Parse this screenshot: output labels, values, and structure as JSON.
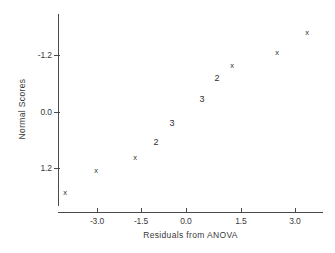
{
  "chart_data": {
    "type": "scatter",
    "title": "",
    "xlabel": "Residuals from ANOVA",
    "ylabel": "Normal Scores",
    "xlim": [
      -4.3,
      3.9
    ],
    "ylim": [
      -2.1,
      1.85
    ],
    "xticks": [
      -3.0,
      -1.5,
      0.0,
      1.5,
      3.0
    ],
    "xticklabels": [
      "-3.0",
      "-1.5",
      "0.0",
      "1.5",
      "3.0"
    ],
    "yticks": [
      -1.2,
      0.0,
      1.2
    ],
    "yticklabels": [
      "-1.2",
      "0.0",
      "1.2"
    ],
    "grid": false,
    "legend": null,
    "marker_symbol": "x",
    "note": "Digit labels mark coincident points; the digit is the number of overlapping observations at that location.",
    "points": [
      {
        "x": -3.55,
        "y": -1.73,
        "label": "x",
        "count": 1
      },
      {
        "x": -2.7,
        "y": -1.25,
        "label": "x",
        "count": 1
      },
      {
        "x": -1.63,
        "y": -0.97,
        "label": "x",
        "count": 1
      },
      {
        "x": -1.05,
        "y": -0.65,
        "label": "2",
        "count": 2
      },
      {
        "x": -0.6,
        "y": -0.25,
        "label": "3",
        "count": 3
      },
      {
        "x": 0.22,
        "y": 0.25,
        "label": "3",
        "count": 3
      },
      {
        "x": 0.63,
        "y": 0.7,
        "label": "2",
        "count": 2
      },
      {
        "x": 1.07,
        "y": 0.95,
        "label": "x",
        "count": 1
      },
      {
        "x": 2.3,
        "y": 1.23,
        "label": "x",
        "count": 1
      },
      {
        "x": 3.12,
        "y": 1.65,
        "label": "x",
        "count": 1
      }
    ]
  },
  "pixels": {
    "note": "Rendering geometry for the recreation (plot-area pixel anchors).",
    "x_axis_y": 212,
    "y_axis_x": 58,
    "xticks_px": [
      97,
      141,
      186,
      241,
      295
    ],
    "yticks_px": [
      55,
      112,
      168
    ],
    "points_px": [
      {
        "left": 65,
        "top": 193,
        "label": "x",
        "kind": "marker"
      },
      {
        "left": 96,
        "top": 171,
        "label": "x",
        "kind": "marker"
      },
      {
        "left": 135,
        "top": 158,
        "label": "x",
        "kind": "marker"
      },
      {
        "left": 156,
        "top": 143,
        "label": "2",
        "kind": "count"
      },
      {
        "left": 172,
        "top": 124,
        "label": "3",
        "kind": "count"
      },
      {
        "left": 202,
        "top": 100,
        "label": "3",
        "kind": "count"
      },
      {
        "left": 217,
        "top": 79,
        "label": "2",
        "kind": "count"
      },
      {
        "left": 232,
        "top": 66,
        "label": "x",
        "kind": "marker"
      },
      {
        "left": 277,
        "top": 53,
        "label": "x",
        "kind": "marker"
      },
      {
        "left": 307,
        "top": 33,
        "label": "x",
        "kind": "marker"
      }
    ]
  }
}
